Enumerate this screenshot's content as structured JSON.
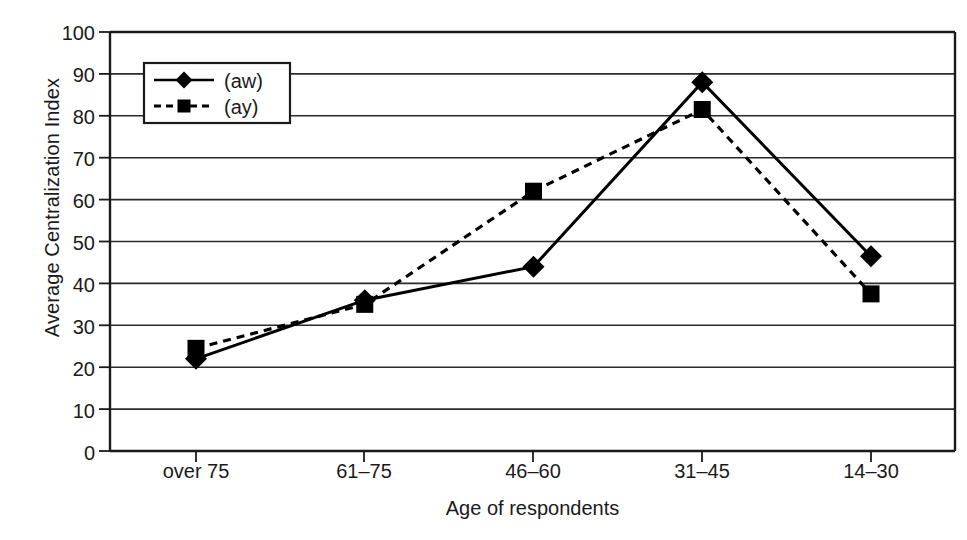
{
  "chart_data": {
    "type": "line",
    "title": "",
    "xlabel": "Age of respondents",
    "ylabel": "Average Centralization Index",
    "categories": [
      "over 75",
      "61–75",
      "46–60",
      "31–45",
      "14–30"
    ],
    "yticks": [
      0,
      10,
      20,
      30,
      40,
      50,
      60,
      70,
      80,
      90,
      100
    ],
    "ylim": [
      0,
      100
    ],
    "grid": true,
    "legend_position": "top-left-inside",
    "series": [
      {
        "name": "(aw)",
        "style": "solid",
        "marker": "diamond",
        "color": "#000000",
        "values": [
          22,
          36,
          44,
          88,
          46.5
        ]
      },
      {
        "name": "(ay)",
        "style": "dashed",
        "marker": "square",
        "color": "#000000",
        "values": [
          24.5,
          35,
          62,
          81.5,
          37.5
        ]
      }
    ]
  },
  "axis": {
    "frame_color": "#1a1a1a",
    "grid_color": "#2b2b2b"
  }
}
